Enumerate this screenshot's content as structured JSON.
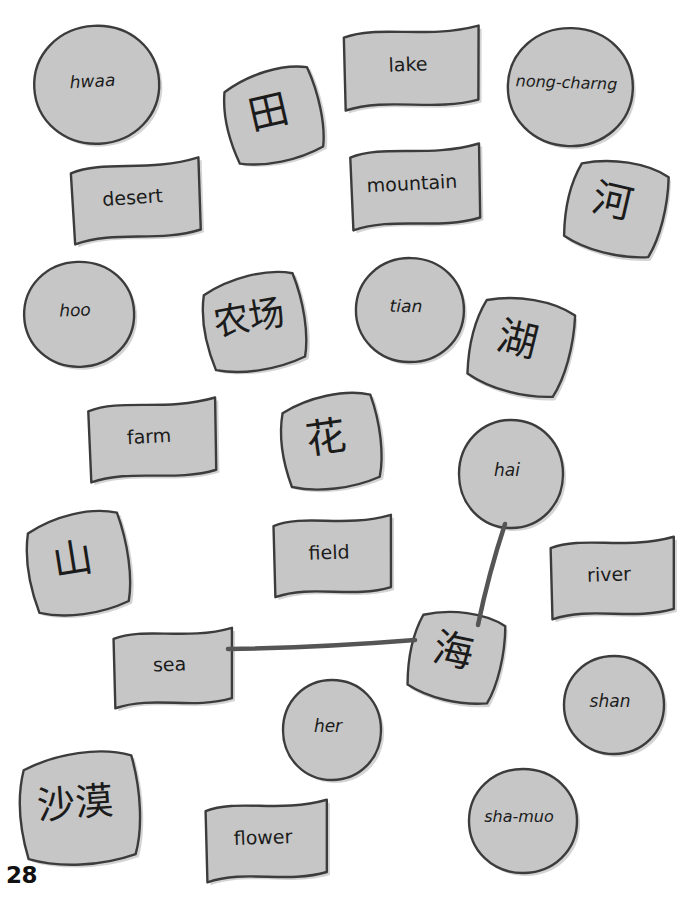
{
  "page": {
    "number": "28",
    "background_color": "#ffffff",
    "card_fill": "#c6c6c6",
    "card_stroke": "#3c3c3c",
    "text_color": "#1b1b1b",
    "link_color": "#555555",
    "top_cut_text": ""
  },
  "legend": {
    "shapes": [
      "circle",
      "banner",
      "diamond"
    ],
    "circle_meaning": "romanized-pronunciation",
    "banner_meaning": "english-word",
    "diamond_meaning": "chinese-character"
  },
  "cards": [
    {
      "id": "hwaa",
      "text": "hwaa",
      "shape": "circle",
      "kind": "roman",
      "x": 30,
      "y": 22,
      "w": 125,
      "h": 118,
      "rot": -3,
      "font": 17
    },
    {
      "id": "lake",
      "text": "lake",
      "shape": "banner",
      "kind": "eng",
      "x": 338,
      "y": 23,
      "w": 140,
      "h": 82,
      "rot": -2,
      "font": 19
    },
    {
      "id": "nong-charng",
      "text": "nong-charng",
      "shape": "circle",
      "kind": "roman",
      "x": 504,
      "y": 24,
      "w": 125,
      "h": 118,
      "rot": 2,
      "font": 16
    },
    {
      "id": "tian-hanzi",
      "text": "田",
      "shape": "diamond",
      "kind": "han",
      "x": 218,
      "y": 62,
      "w": 100,
      "h": 100,
      "rot": -13,
      "font": 40
    },
    {
      "id": "desert",
      "text": "desert",
      "shape": "banner",
      "kind": "eng",
      "x": 66,
      "y": 157,
      "w": 133,
      "h": 80,
      "rot": -4,
      "font": 19
    },
    {
      "id": "mountain",
      "text": "mountain",
      "shape": "banner",
      "kind": "eng",
      "x": 345,
      "y": 142,
      "w": 134,
      "h": 82,
      "rot": -3,
      "font": 19
    },
    {
      "id": "he-hanzi",
      "text": "河",
      "shape": "diamond",
      "kind": "han",
      "x": 562,
      "y": 150,
      "w": 102,
      "h": 102,
      "rot": 13,
      "font": 40
    },
    {
      "id": "hoo",
      "text": "hoo",
      "shape": "circle",
      "kind": "roman",
      "x": 20,
      "y": 258,
      "w": 110,
      "h": 105,
      "rot": -2,
      "font": 17
    },
    {
      "id": "nongchang",
      "text": "农场",
      "shape": "diamond",
      "kind": "han",
      "x": 196,
      "y": 266,
      "w": 106,
      "h": 104,
      "rot": -10,
      "font": 36
    },
    {
      "id": "tian",
      "text": "tian",
      "shape": "circle",
      "kind": "roman",
      "x": 352,
      "y": 254,
      "w": 108,
      "h": 104,
      "rot": 1,
      "font": 17
    },
    {
      "id": "hu-hanzi",
      "text": "湖",
      "shape": "diamond",
      "kind": "han",
      "x": 466,
      "y": 287,
      "w": 104,
      "h": 104,
      "rot": 14,
      "font": 40
    },
    {
      "id": "farm",
      "text": "farm",
      "shape": "banner",
      "kind": "eng",
      "x": 83,
      "y": 396,
      "w": 132,
      "h": 80,
      "rot": -3,
      "font": 19
    },
    {
      "id": "hua-hanzi",
      "text": "花",
      "shape": "diamond",
      "kind": "han",
      "x": 274,
      "y": 386,
      "w": 104,
      "h": 102,
      "rot": -8,
      "font": 40
    },
    {
      "id": "hai",
      "text": "hai",
      "shape": "circle",
      "kind": "roman",
      "x": 455,
      "y": 416,
      "w": 104,
      "h": 108,
      "rot": 0,
      "font": 17
    },
    {
      "id": "shan-hanzi",
      "text": "山",
      "shape": "diamond",
      "kind": "han",
      "x": 20,
      "y": 504,
      "w": 106,
      "h": 110,
      "rot": -9,
      "font": 40
    },
    {
      "id": "field",
      "text": "field",
      "shape": "banner",
      "kind": "eng",
      "x": 268,
      "y": 512,
      "w": 122,
      "h": 80,
      "rot": -2,
      "font": 19
    },
    {
      "id": "river",
      "text": "river",
      "shape": "banner",
      "kind": "eng",
      "x": 545,
      "y": 534,
      "w": 128,
      "h": 80,
      "rot": -2,
      "font": 19
    },
    {
      "id": "sea",
      "text": "sea",
      "shape": "banner",
      "kind": "eng",
      "x": 108,
      "y": 625,
      "w": 123,
      "h": 78,
      "rot": -2,
      "font": 19
    },
    {
      "id": "hai-hanzi",
      "text": "海",
      "shape": "diamond",
      "kind": "han",
      "x": 405,
      "y": 601,
      "w": 96,
      "h": 98,
      "rot": 12,
      "font": 40
    },
    {
      "id": "shan",
      "text": "shan",
      "shape": "circle",
      "kind": "roman",
      "x": 560,
      "y": 652,
      "w": 100,
      "h": 98,
      "rot": 0,
      "font": 17
    },
    {
      "id": "her",
      "text": "her",
      "shape": "circle",
      "kind": "roman",
      "x": 279,
      "y": 676,
      "w": 98,
      "h": 100,
      "rot": 0,
      "font": 17
    },
    {
      "id": "shamo-hanzi",
      "text": "沙漠",
      "shape": "diamond",
      "kind": "han",
      "x": 12,
      "y": 742,
      "w": 126,
      "h": 122,
      "rot": -4,
      "font": 38
    },
    {
      "id": "flower",
      "text": "flower",
      "shape": "banner",
      "kind": "eng",
      "x": 200,
      "y": 797,
      "w": 126,
      "h": 80,
      "rot": -2,
      "font": 19
    },
    {
      "id": "sha-muo",
      "text": "sha-muo",
      "shape": "circle",
      "kind": "roman",
      "x": 465,
      "y": 765,
      "w": 108,
      "h": 104,
      "rot": 0,
      "font": 16
    }
  ],
  "links": [
    {
      "id": "link-hai-to-hai-hanzi",
      "from": "hai",
      "to": "hai-hanzi",
      "x1": 505,
      "y1": 524,
      "x2": 478,
      "y2": 625
    },
    {
      "id": "link-sea-to-hai-hanzi",
      "from": "sea",
      "to": "hai-hanzi",
      "x1": 228,
      "y1": 649,
      "x2": 415,
      "y2": 640
    }
  ]
}
